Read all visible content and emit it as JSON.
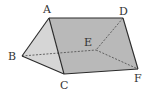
{
  "diagram": {
    "type": "triangular-prism",
    "colors": {
      "face_main": "#b9b9b9",
      "face_side": "#d6d6d6",
      "edge": "#2a2a2a",
      "hidden_edge": "#555555"
    },
    "vertices": {
      "A": {
        "label": "A",
        "x": 49,
        "y": 18,
        "lx": 43,
        "ly": 13
      },
      "D": {
        "label": "D",
        "x": 123,
        "y": 18,
        "lx": 119,
        "ly": 15
      },
      "B": {
        "label": "B",
        "x": 22,
        "y": 56,
        "lx": 9,
        "ly": 60
      },
      "C": {
        "label": "C",
        "x": 64,
        "y": 74,
        "lx": 61,
        "ly": 88
      },
      "E": {
        "label": "E",
        "x": 96,
        "y": 50,
        "lx": 84,
        "ly": 46
      },
      "F": {
        "label": "F",
        "x": 138,
        "y": 69,
        "lx": 134,
        "ly": 81
      }
    },
    "visible_edges": [
      "AB",
      "BC",
      "AC",
      "AD",
      "DF",
      "CF"
    ],
    "hidden_edges": [
      "BE",
      "DE",
      "EF"
    ]
  }
}
